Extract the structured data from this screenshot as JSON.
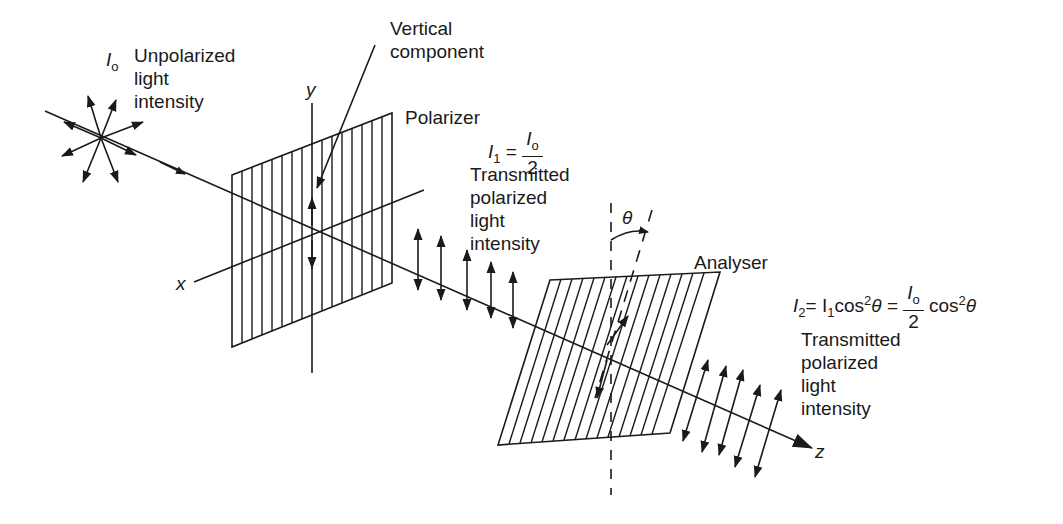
{
  "labels": {
    "source_symbol": "I",
    "source_subscript": "o",
    "source_text": [
      "Unpolarized",
      "light",
      "intensity"
    ],
    "vertical_component": [
      "Vertical",
      "component"
    ],
    "polarizer": "Polarizer",
    "i1_lhs": "I",
    "i1_sub": "1",
    "i1_eq": "=",
    "i1_num": "I",
    "i1_num_sub": "o",
    "i1_den": "2",
    "transmitted1": [
      "Transmitted",
      "polarized",
      "light",
      "intensity"
    ],
    "theta": "θ",
    "analyser": "Analyser",
    "i2_lhs": "I",
    "i2_sub": "2",
    "i2_mid": "= I",
    "i2_mid_sub": "1",
    "i2_cos": "cos",
    "i2_sup": "2",
    "i2_theta": "θ =",
    "i2_num": "I",
    "i2_num_sub": "o",
    "i2_den": "2",
    "i2_tail_cos": "cos",
    "i2_tail_sup": "2",
    "i2_tail_theta": "θ",
    "transmitted2": [
      "Transmitted",
      "polarized",
      "light",
      "intensity"
    ],
    "axis_x": "x",
    "axis_y": "y",
    "axis_z": "z"
  },
  "colors": {
    "ink": "#1a1a1a",
    "background": "#ffffff"
  }
}
